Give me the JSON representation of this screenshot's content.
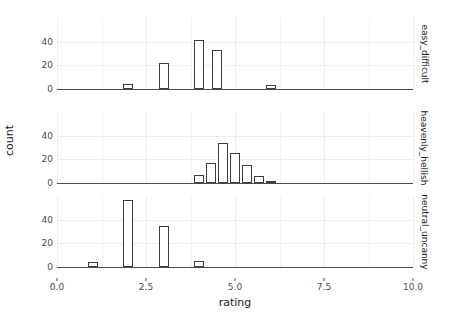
{
  "chart_data": {
    "type": "bar",
    "title": "",
    "subtitle": "",
    "xlabel": "rating",
    "ylabel": "count",
    "xlim": [
      0,
      10
    ],
    "ylim": [
      0,
      60
    ],
    "x_ticks": [
      "0.0",
      "2.5",
      "5.0",
      "7.5",
      "10.0"
    ],
    "x_tick_values": [
      0.0,
      2.5,
      5.0,
      7.5,
      10.0
    ],
    "y_ticks": [
      "0",
      "20",
      "40"
    ],
    "y_tick_values": [
      0,
      20,
      40
    ],
    "grid": true,
    "legend": "none",
    "facet_direction": "vertical",
    "facet_strip_position": "right",
    "bar_width": 0.28,
    "bar_fill": "#ffffff",
    "bar_border": "#3d3d3d",
    "panel_background": "#ffffff",
    "grid_color": "#ededed",
    "axis_color": "#4d4d4d",
    "facets": [
      {
        "label": "easy_difficult",
        "bars": [
          {
            "x": 2.0,
            "value": 4
          },
          {
            "x": 3.0,
            "value": 22
          },
          {
            "x": 4.0,
            "value": 41
          },
          {
            "x": 4.5,
            "value": 33
          },
          {
            "x": 6.0,
            "value": 3
          }
        ]
      },
      {
        "label": "heavenly_hellish",
        "bars": [
          {
            "x": 4.0,
            "value": 7
          },
          {
            "x": 4.33,
            "value": 17
          },
          {
            "x": 4.67,
            "value": 34
          },
          {
            "x": 5.0,
            "value": 25
          },
          {
            "x": 5.33,
            "value": 15
          },
          {
            "x": 5.67,
            "value": 6
          },
          {
            "x": 6.0,
            "value": 1
          }
        ]
      },
      {
        "label": "neutral_uncanny",
        "bars": [
          {
            "x": 1.0,
            "value": 4
          },
          {
            "x": 2.0,
            "value": 57
          },
          {
            "x": 3.0,
            "value": 35
          },
          {
            "x": 4.0,
            "value": 5
          }
        ]
      }
    ]
  }
}
